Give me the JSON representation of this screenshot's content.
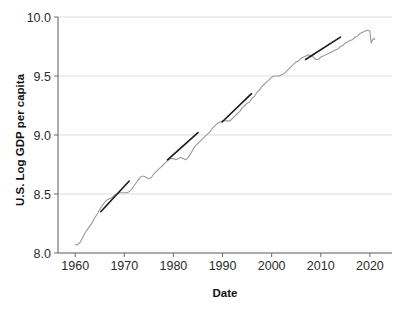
{
  "figure": {
    "background_color": "#ffffff",
    "clipped_top_text": "per capita"
  },
  "chart_data": {
    "type": "line",
    "title": "",
    "xlabel": "Date",
    "ylabel": "U.S. Log GDP per capita",
    "xlim": [
      1956.5,
      2024.5
    ],
    "ylim": [
      8.0,
      10.0
    ],
    "grid": true,
    "grid_axis": "y",
    "legend": "none",
    "xticks": [
      1960,
      1970,
      1980,
      1990,
      2000,
      2010,
      2020
    ],
    "xtick_labels": [
      "1960",
      "1970",
      "1980",
      "1990",
      "2000",
      "2010",
      "2020"
    ],
    "yticks": [
      8.0,
      8.5,
      9.0,
      9.5,
      10.0
    ],
    "ytick_labels": [
      "8.0",
      "8.5",
      "9.0",
      "9.5",
      "10.0"
    ],
    "series": [
      {
        "name": "U.S. Log GDP per capita",
        "color": "#9a9a9a",
        "line_width": 1.1,
        "x": [
          1960.0,
          1960.5,
          1961.0,
          1961.5,
          1962.0,
          1962.5,
          1963.0,
          1963.5,
          1964.0,
          1964.5,
          1965.0,
          1965.5,
          1966.0,
          1966.5,
          1967.0,
          1967.5,
          1968.0,
          1968.5,
          1969.0,
          1969.5,
          1970.0,
          1970.5,
          1971.0,
          1971.5,
          1972.0,
          1972.5,
          1973.0,
          1973.5,
          1974.0,
          1974.5,
          1975.0,
          1975.5,
          1976.0,
          1976.5,
          1977.0,
          1977.5,
          1978.0,
          1978.5,
          1979.0,
          1979.5,
          1980.0,
          1980.5,
          1981.0,
          1981.5,
          1982.0,
          1982.5,
          1983.0,
          1983.5,
          1984.0,
          1984.5,
          1985.0,
          1985.5,
          1986.0,
          1986.5,
          1987.0,
          1987.5,
          1988.0,
          1988.5,
          1989.0,
          1989.5,
          1990.0,
          1990.5,
          1991.0,
          1991.5,
          1992.0,
          1992.5,
          1993.0,
          1993.5,
          1994.0,
          1994.5,
          1995.0,
          1995.5,
          1996.0,
          1996.5,
          1997.0,
          1997.5,
          1998.0,
          1998.5,
          1999.0,
          1999.5,
          2000.0,
          2000.5,
          2001.0,
          2001.5,
          2002.0,
          2002.5,
          2003.0,
          2003.5,
          2004.0,
          2004.5,
          2005.0,
          2005.5,
          2006.0,
          2006.5,
          2007.0,
          2007.5,
          2008.0,
          2008.5,
          2009.0,
          2009.5,
          2010.0,
          2010.5,
          2011.0,
          2011.5,
          2012.0,
          2012.5,
          2013.0,
          2013.5,
          2014.0,
          2014.5,
          2015.0,
          2015.5,
          2016.0,
          2016.5,
          2017.0,
          2017.5,
          2018.0,
          2018.5,
          2019.0,
          2019.5,
          2020.0,
          2020.25,
          2020.5,
          2020.75,
          2021.0
        ],
        "y": [
          8.07,
          8.07,
          8.09,
          8.13,
          8.17,
          8.2,
          8.23,
          8.26,
          8.3,
          8.33,
          8.37,
          8.4,
          8.43,
          8.45,
          8.46,
          8.47,
          8.49,
          8.5,
          8.51,
          8.51,
          8.51,
          8.51,
          8.52,
          8.54,
          8.57,
          8.6,
          8.63,
          8.65,
          8.65,
          8.64,
          8.63,
          8.64,
          8.67,
          8.69,
          8.71,
          8.73,
          8.75,
          8.77,
          8.79,
          8.8,
          8.8,
          8.79,
          8.8,
          8.81,
          8.8,
          8.79,
          8.81,
          8.84,
          8.88,
          8.91,
          8.93,
          8.95,
          8.97,
          8.99,
          9.01,
          9.03,
          9.06,
          9.08,
          9.1,
          9.11,
          9.12,
          9.12,
          9.12,
          9.12,
          9.14,
          9.16,
          9.18,
          9.2,
          9.23,
          9.25,
          9.27,
          9.28,
          9.31,
          9.33,
          9.36,
          9.38,
          9.41,
          9.43,
          9.45,
          9.47,
          9.49,
          9.5,
          9.5,
          9.5,
          9.51,
          9.52,
          9.54,
          9.56,
          9.58,
          9.6,
          9.62,
          9.63,
          9.65,
          9.66,
          9.67,
          9.68,
          9.67,
          9.66,
          9.64,
          9.64,
          9.66,
          9.67,
          9.68,
          9.69,
          9.7,
          9.71,
          9.72,
          9.73,
          9.75,
          9.76,
          9.78,
          9.79,
          9.8,
          9.81,
          9.83,
          9.84,
          9.86,
          9.87,
          9.88,
          9.89,
          9.88,
          9.78,
          9.8,
          9.82,
          9.81
        ]
      }
    ],
    "annotations": {
      "description": "Four straight dark trend-line overlays marking distinct growth regimes",
      "color": "#1a1a1a",
      "line_width": 1.6,
      "trend_lines": [
        {
          "name": "trend-1960s",
          "x_start": 1965.2,
          "y_start": 8.35,
          "x_end": 1971.0,
          "y_end": 8.61
        },
        {
          "name": "trend-1980s",
          "x_start": 1978.8,
          "y_start": 8.79,
          "x_end": 1985.0,
          "y_end": 9.02
        },
        {
          "name": "trend-1990s",
          "x_start": 1989.9,
          "y_start": 9.11,
          "x_end": 1995.9,
          "y_end": 9.35
        },
        {
          "name": "trend-2010s",
          "x_start": 2006.9,
          "y_start": 9.64,
          "x_end": 2014.0,
          "y_end": 9.83
        }
      ]
    }
  }
}
